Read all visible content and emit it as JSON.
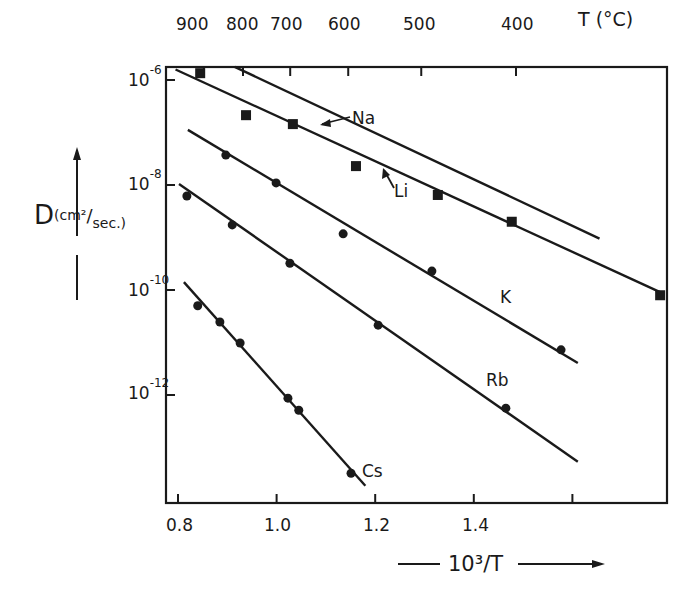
{
  "chart_data": {
    "type": "scatter",
    "title": "",
    "xlabel": "10^3/T",
    "ylabel": "D (cm²/sec.)",
    "top_axis_label": "T (°C)",
    "x_range": [
      0.78,
      1.78
    ],
    "y_log_range": [
      -13.8,
      -5.75
    ],
    "y_scale": "log",
    "grid": false,
    "legend": "inline labels",
    "x_ticks": [
      0.8,
      1.0,
      1.2,
      1.4,
      1.6
    ],
    "x_tick_labels": [
      "0.8",
      "1.0",
      "1.2",
      "1.4",
      ""
    ],
    "y_ticks_log": [
      -6,
      -8,
      -10,
      -12
    ],
    "y_tick_labels": [
      "10^-6",
      "10^-8",
      "10^-10",
      "10^-12"
    ],
    "top_ticks_celsius": [
      900,
      800,
      700,
      600,
      500,
      400
    ],
    "series": [
      {
        "name": "Na",
        "marker": "none",
        "fit_line": {
          "x": [
            0.915,
            1.655
          ],
          "log10_D": [
            -5.75,
            -9.02
          ]
        },
        "points": []
      },
      {
        "name": "Li",
        "marker": "square",
        "fit_line": {
          "x": [
            0.795,
            1.78
          ],
          "log10_D": [
            -5.8,
            -10.05
          ]
        },
        "points": [
          {
            "x": 0.845,
            "log10_D": -5.87
          },
          {
            "x": 0.938,
            "log10_D": -6.67
          },
          {
            "x": 1.033,
            "log10_D": -6.84
          },
          {
            "x": 1.161,
            "log10_D": -7.64
          },
          {
            "x": 1.327,
            "log10_D": -8.19
          },
          {
            "x": 1.477,
            "log10_D": -8.7
          },
          {
            "x": 1.778,
            "log10_D": -10.1
          }
        ]
      },
      {
        "name": "K",
        "marker": "circle",
        "fit_line": {
          "x": [
            0.82,
            1.611
          ],
          "log10_D": [
            -6.95,
            -11.39
          ]
        },
        "points": [
          {
            "x": 0.897,
            "log10_D": -7.43
          },
          {
            "x": 0.999,
            "log10_D": -7.96
          },
          {
            "x": 1.135,
            "log10_D": -8.93
          },
          {
            "x": 1.315,
            "log10_D": -9.64
          },
          {
            "x": 1.577,
            "log10_D": -11.14
          }
        ]
      },
      {
        "name": "Rb",
        "marker": "circle",
        "fit_line": {
          "x": [
            0.802,
            1.611
          ],
          "log10_D": [
            -7.98,
            -13.27
          ]
        },
        "points": [
          {
            "x": 0.818,
            "log10_D": -8.21
          },
          {
            "x": 0.91,
            "log10_D": -8.76
          },
          {
            "x": 1.027,
            "log10_D": -9.49
          },
          {
            "x": 1.206,
            "log10_D": -10.67
          },
          {
            "x": 1.465,
            "log10_D": -12.25
          }
        ]
      },
      {
        "name": "Cs",
        "marker": "circle",
        "fit_line": {
          "x": [
            0.812,
            1.18
          ],
          "log10_D": [
            -9.85,
            -13.73
          ]
        },
        "points": [
          {
            "x": 0.84,
            "log10_D": -10.3
          },
          {
            "x": 0.885,
            "log10_D": -10.61
          },
          {
            "x": 0.926,
            "log10_D": -11.01
          },
          {
            "x": 1.023,
            "log10_D": -12.06
          },
          {
            "x": 1.045,
            "log10_D": -12.29
          },
          {
            "x": 1.151,
            "log10_D": -13.49
          }
        ]
      }
    ]
  },
  "labels": {
    "top_axis": [
      "900",
      "800",
      "700",
      "600",
      "500",
      "400"
    ],
    "top_axis_title": "T (°C)",
    "x_ticks": [
      "0.8",
      "1.0",
      "1.2",
      "1.4"
    ],
    "y_base": "10",
    "y_exps": [
      "-6",
      "-8",
      "-10",
      "-12"
    ],
    "y_title_main": "D",
    "y_title_unit_num": "(cm²",
    "y_title_unit_den": "sec.)",
    "x_title": "10³/T",
    "series_labels": {
      "Na": "Na",
      "Li": "Li",
      "K": "K",
      "Rb": "Rb",
      "Cs": "Cs"
    }
  }
}
